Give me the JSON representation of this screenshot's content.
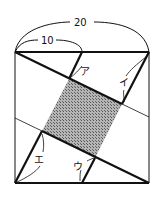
{
  "diagram": {
    "type": "geometry",
    "labels": {
      "total_width": "20",
      "half_width": "10",
      "a": "ア",
      "i": "イ",
      "u": "ウ",
      "e": "エ"
    },
    "colors": {
      "line": "#111111",
      "shade": "#8a8a8a",
      "background": "#ffffff"
    }
  }
}
